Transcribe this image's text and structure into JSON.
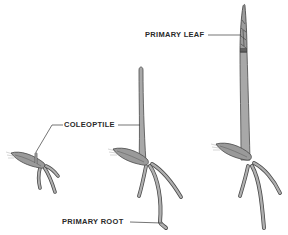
{
  "diagram": {
    "type": "botanical-illustration",
    "stages": [
      {
        "index": 1,
        "description": "germinating seed with short coleoptile and emerging roots"
      },
      {
        "index": 2,
        "description": "seedling with elongated coleoptile and branched roots"
      },
      {
        "index": 3,
        "description": "seedling with primary leaf emerging from coleoptile tip"
      }
    ],
    "labels": {
      "coleoptile": "COLEOPTILE",
      "primary_leaf": "PRIMARY LEAF",
      "primary_root": "PRIMARY ROOT"
    },
    "colors": {
      "plant_fill": "#a8a8a8",
      "plant_outline": "#4a4a4a",
      "seed_fill": "#9a9a9a",
      "leader_line": "#3a3a3a",
      "label_text": "#2a2a2a",
      "background": "#ffffff"
    }
  }
}
